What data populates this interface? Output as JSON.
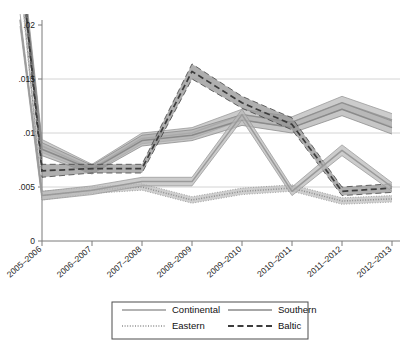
{
  "chart_data": {
    "type": "line",
    "title": "",
    "subtitle": "",
    "xlabel": "",
    "ylabel": "",
    "categories": [
      "2005–2006",
      "2006–2007",
      "2007–2008",
      "2008–2009",
      "2009–2010",
      "2010–2011",
      "2011–2012",
      "2012–2013"
    ],
    "ytick_labels": [
      "0",
      ".005",
      ".01",
      ".015",
      ".02"
    ],
    "ytick_values": [
      0,
      0.005,
      0.01,
      0.015,
      0.02
    ],
    "ylim": [
      0,
      0.0215
    ],
    "grid": "horizontal",
    "legend_position": "bottom",
    "note_offscreen": "All four series enter from above the .02 gridline at the left edge, descending steeply into the first plotted category.",
    "series": [
      {
        "name": "Continental",
        "style": "solid",
        "color": "#9a9a9a",
        "band_color": "#b9b9b9",
        "values": [
          0.0088,
          0.0067,
          0.0095,
          0.01,
          0.0117,
          0.011,
          0.0128,
          0.0112
        ],
        "band_low": [
          0.0082,
          0.0063,
          0.009,
          0.0095,
          0.0112,
          0.0105,
          0.0122,
          0.0106
        ],
        "band_high": [
          0.0094,
          0.0071,
          0.01,
          0.0105,
          0.0122,
          0.0115,
          0.0134,
          0.0118
        ],
        "entry_value": 0.0272
      },
      {
        "name": "Southern",
        "style": "solid",
        "color": "#8a8a8a",
        "band_color": "#b0b0b0",
        "values": [
          0.0085,
          0.0066,
          0.0093,
          0.0098,
          0.0112,
          0.0105,
          0.0122,
          0.0105
        ],
        "band_low": [
          0.0079,
          0.0062,
          0.0088,
          0.0093,
          0.0107,
          0.01,
          0.0116,
          0.0099
        ],
        "band_high": [
          0.0091,
          0.007,
          0.0098,
          0.0103,
          0.0117,
          0.011,
          0.0128,
          0.0111
        ],
        "entry_value": 0.0262
      },
      {
        "name": "Eastern",
        "style": "dotted",
        "color": "#8e8e8e",
        "band_color": "#bdbdbd",
        "values": [
          0.0042,
          0.0047,
          0.005,
          0.0038,
          0.0046,
          0.0049,
          0.0037,
          0.0039
        ],
        "band_low": [
          0.0038,
          0.0044,
          0.0047,
          0.0035,
          0.0043,
          0.0046,
          0.0034,
          0.0036
        ],
        "band_high": [
          0.0046,
          0.005,
          0.0053,
          0.0041,
          0.0049,
          0.0052,
          0.004,
          0.0042
        ],
        "entry_value": 0.0248
      },
      {
        "name": "Baltic",
        "style": "dashed",
        "color": "#3c3c3c",
        "band_color": "#909090",
        "values": [
          0.0065,
          0.0067,
          0.0067,
          0.0157,
          0.0128,
          0.0108,
          0.0046,
          0.0049
        ],
        "band_low": [
          0.0059,
          0.0063,
          0.0063,
          0.015,
          0.0123,
          0.0103,
          0.0042,
          0.0045
        ],
        "band_high": [
          0.0071,
          0.0071,
          0.0071,
          0.0164,
          0.0134,
          0.0114,
          0.005,
          0.0053
        ],
        "entry_value": 0.0268
      },
      {
        "name": "Southern-secondary",
        "style": "solid",
        "color": "#9a9a9a",
        "band_color": "#b9b9b9",
        "hidden_from_legend": true,
        "values": [
          0.0042,
          0.0047,
          0.0055,
          0.0055,
          0.0117,
          0.0046,
          0.0084,
          0.005
        ],
        "band_low": [
          0.0038,
          0.0043,
          0.0051,
          0.0051,
          0.0112,
          0.0042,
          0.0079,
          0.0046
        ],
        "band_high": [
          0.0046,
          0.0051,
          0.0059,
          0.0059,
          0.0122,
          0.005,
          0.0089,
          0.0054
        ],
        "entry_value": 0.0205
      }
    ]
  },
  "legend": {
    "entries": [
      {
        "label": "Continental",
        "style": "solid",
        "color": "#9a9a9a"
      },
      {
        "label": "Southern",
        "style": "solid",
        "color": "#8a8a8a"
      },
      {
        "label": "Eastern",
        "style": "dotted",
        "color": "#8e8e8e"
      },
      {
        "label": "Baltic",
        "style": "dashed",
        "color": "#3c3c3c"
      }
    ]
  }
}
